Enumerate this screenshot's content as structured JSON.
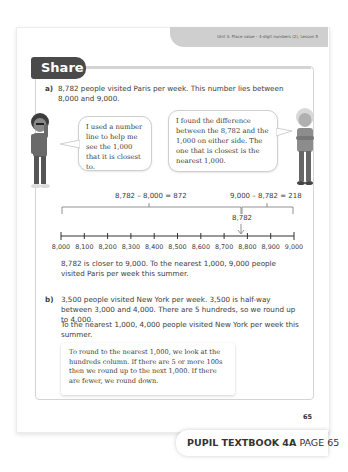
{
  "header": {
    "unit_label": "Unit 3: Place value – 4-digit numbers (2), Lesson 5",
    "section_title": "Share"
  },
  "part_a": {
    "label": "a)",
    "intro": "8,782 people visited Paris per week. This number lies between 8,000 and 9,000.",
    "bubble_left": "I used a number line to help me see the 1,000 that it is closest to.",
    "bubble_right": "I found the difference between the 8,782 and the 1,000 on either side. The one that is closest is the nearest 1,000.",
    "equation_left": "8,782 – 8,000 = 872",
    "equation_right": "9,000 – 8,782 = 218",
    "marker_label": "8,782",
    "conclusion": "8,782 is closer to 9,000. To the nearest 1,000, 9,000 people visited Paris per week this summer."
  },
  "number_line": {
    "ticks": [
      "8,000",
      "8,100",
      "8,200",
      "8,300",
      "8,400",
      "8,500",
      "8,600",
      "8,700",
      "8,800",
      "8,900",
      "9,000"
    ],
    "marker_value": 8782
  },
  "part_b": {
    "label": "b)",
    "text1": "3,500 people visited New York per week. 3,500 is half-way between 3,000 and 4,000. There are 5 hundreds, so we round up to 4,000.",
    "text2": "To the nearest 1,000, 4,000 people visited New York per week this summer.",
    "rule": "To round to the nearest 1,000, we look at the hundreds column. If there are 5 or more 100s then we round up to the next 1,000. If there are fewer, we round down."
  },
  "footer": {
    "page_number": "65",
    "book": "PUPIL TEXTBOOK 4A",
    "page": "PAGE 65"
  }
}
